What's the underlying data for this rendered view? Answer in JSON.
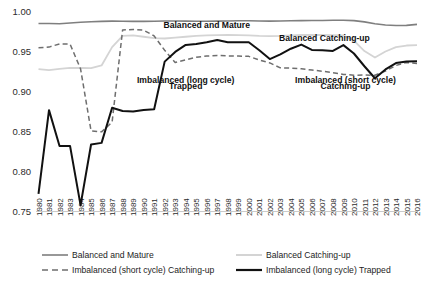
{
  "chart_data": {
    "type": "line",
    "title": "",
    "xlabel": "",
    "ylabel": "",
    "ylim": [
      0.75,
      1.0
    ],
    "yticks": [
      "1.00",
      "0.95",
      "0.90",
      "0.85",
      "0.80",
      "0.75"
    ],
    "ytick_values": [
      1.0,
      0.95,
      0.9,
      0.85,
      0.8,
      0.75
    ],
    "grid": false,
    "legend_position": "bottom",
    "categories": [
      "1980",
      "1981",
      "1982",
      "1983",
      "1984",
      "1985",
      "1986",
      "1987",
      "1988",
      "1989",
      "1990",
      "1991",
      "1992",
      "1993",
      "1994",
      "1995",
      "1996",
      "1997",
      "1998",
      "1999",
      "2000",
      "2001",
      "2002",
      "2003",
      "2004",
      "2005",
      "2006",
      "2007",
      "2008",
      "2009",
      "2010",
      "2011",
      "2012",
      "2013",
      "2014",
      "2015",
      "2016"
    ],
    "series": [
      {
        "name": "Balanced and Mature",
        "color": "#7f7f7f",
        "style": "solid",
        "width": 1.6,
        "values": [
          0.9855,
          0.9855,
          0.9853,
          0.9862,
          0.9872,
          0.9878,
          0.9882,
          0.9886,
          0.9884,
          0.9883,
          0.9882,
          0.9884,
          0.9888,
          0.9888,
          0.9886,
          0.9884,
          0.9884,
          0.9886,
          0.9888,
          0.989,
          0.989,
          0.9888,
          0.9886,
          0.9888,
          0.989,
          0.9892,
          0.9893,
          0.9894,
          0.9896,
          0.9897,
          0.9892,
          0.9876,
          0.9852,
          0.9838,
          0.983,
          0.9832,
          0.9845
        ]
      },
      {
        "name": "Balanced Catching-up",
        "color": "#d4d4d4",
        "style": "solid",
        "width": 1.8,
        "values": [
          0.9285,
          0.9272,
          0.9288,
          0.93,
          0.9298,
          0.9296,
          0.933,
          0.956,
          0.97,
          0.9706,
          0.969,
          0.9672,
          0.9668,
          0.9678,
          0.969,
          0.97,
          0.9706,
          0.971,
          0.9712,
          0.971,
          0.9706,
          0.97,
          0.9698,
          0.97,
          0.9706,
          0.9712,
          0.9714,
          0.9712,
          0.971,
          0.9706,
          0.964,
          0.951,
          0.943,
          0.9505,
          0.956,
          0.958,
          0.9585
        ]
      },
      {
        "name": "Imbalanced (short cycle) Catching-up",
        "color": "#6e6e6e",
        "style": "dashed",
        "width": 1.5,
        "values": [
          0.9552,
          0.956,
          0.96,
          0.9598,
          0.9288,
          0.851,
          0.8498,
          0.862,
          0.9775,
          0.978,
          0.9772,
          0.97,
          0.952,
          0.9368,
          0.94,
          0.9432,
          0.9448,
          0.9456,
          0.945,
          0.9448,
          0.9444,
          0.9398,
          0.9362,
          0.93,
          0.9298,
          0.9288,
          0.9272,
          0.9258,
          0.924,
          0.9218,
          0.9208,
          0.921,
          0.9208,
          0.926,
          0.933,
          0.9368,
          0.9355
        ]
      },
      {
        "name": "Imbalanced (long cycle) Trapped",
        "color": "#111111",
        "style": "solid",
        "width": 2.0,
        "values": [
          0.772,
          0.877,
          0.832,
          0.8322,
          0.758,
          0.834,
          0.836,
          0.88,
          0.876,
          0.8752,
          0.8772,
          0.8782,
          0.9378,
          0.95,
          0.9588,
          0.96,
          0.962,
          0.9648,
          0.962,
          0.9622,
          0.962,
          0.952,
          0.941,
          0.9468,
          0.954,
          0.9592,
          0.9525,
          0.952,
          0.9512,
          0.9585,
          0.948,
          0.932,
          0.917,
          0.928,
          0.936,
          0.938,
          0.9382
        ]
      }
    ],
    "annotations": [
      {
        "text": "Balanced and Mature",
        "x_year": 1996.0,
        "y_value": 0.9805
      },
      {
        "text": "Balanced Catching-up",
        "x_year": 2007.2,
        "y_value": 0.9632
      },
      {
        "text": "Imbalanced (long cycle)",
        "x_year": 1994.0,
        "y_value": 0.9115
      },
      {
        "text": "Trapped",
        "x_year": 1994.0,
        "y_value": 0.903
      },
      {
        "text": "Imbalanced (short cycle)",
        "x_year": 2009.2,
        "y_value": 0.9115
      },
      {
        "text": "Catching-up",
        "x_year": 2009.2,
        "y_value": 0.903
      }
    ],
    "legend": [
      {
        "label": "Balanced and Mature",
        "color": "#7f7f7f",
        "style": "solid",
        "width": 1.6
      },
      {
        "label": "Balanced Catching-up",
        "color": "#d4d4d4",
        "style": "solid",
        "width": 2.0
      },
      {
        "label": "Imbalanced (short cycle) Catching-up",
        "color": "#6e6e6e",
        "style": "dashed",
        "width": 1.6
      },
      {
        "label": "Imbalanced (long cycle) Trapped",
        "color": "#111111",
        "style": "solid",
        "width": 2.2
      }
    ]
  }
}
